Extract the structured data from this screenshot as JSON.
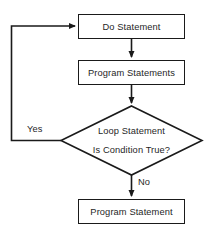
{
  "diagram": {
    "type": "flowchart",
    "background_color": "#ffffff",
    "line_color": "#1a1a1a",
    "text_color": "#1f1f1f",
    "nodes": [
      {
        "id": "do-statement",
        "shape": "rectangle",
        "label": "Do Statement",
        "x": 78,
        "y": 14,
        "width": 107,
        "height": 25
      },
      {
        "id": "program-statements",
        "shape": "rectangle",
        "label": "Program Statements",
        "x": 78,
        "y": 60,
        "width": 107,
        "height": 25
      },
      {
        "id": "loop-decision",
        "shape": "diamond",
        "label_line1": "Loop Statement",
        "label_line2": "Is Condition True?",
        "x": 61,
        "y": 106,
        "width": 141,
        "height": 69
      },
      {
        "id": "program-statement",
        "shape": "rectangle",
        "label": "Program Statement",
        "x": 78,
        "y": 199,
        "width": 107,
        "height": 25
      }
    ],
    "edges": [
      {
        "id": "do-to-program-statements",
        "from": "do-statement",
        "to": "program-statements",
        "label": "",
        "arrow": true
      },
      {
        "id": "program-statements-to-decision",
        "from": "program-statements",
        "to": "loop-decision",
        "label": "",
        "arrow": true
      },
      {
        "id": "decision-yes-loopback",
        "from": "loop-decision",
        "to": "do-statement",
        "label": "Yes",
        "arrow": true
      },
      {
        "id": "decision-no-to-program-statement",
        "from": "loop-decision",
        "to": "program-statement",
        "label": "No",
        "arrow": true
      }
    ]
  }
}
